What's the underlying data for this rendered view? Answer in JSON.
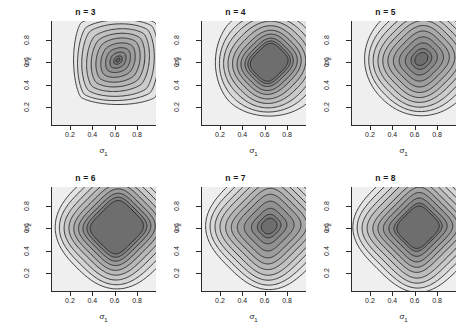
{
  "figure": {
    "kind": "contour-panel-grid",
    "rows": 2,
    "cols": 3,
    "background": "#ffffff",
    "line_color": "#1f1f1f",
    "fill_light": "#efefef",
    "fill_dark": "#6f6f6f"
  },
  "axes": {
    "x_label": "σ",
    "x_label_sub": "1",
    "y_label": "σ",
    "y_label_sub": "2",
    "x_ticks": [
      "0.2",
      "0.4",
      "0.6",
      "0.8"
    ],
    "y_ticks": [
      "0.2",
      "0.4",
      "0.6",
      "0.8"
    ],
    "x_tick_values": [
      0.2,
      0.4,
      0.6,
      0.8
    ],
    "y_tick_values": [
      0.2,
      0.4,
      0.6,
      0.8
    ],
    "xlim": [
      0.03,
      0.97
    ],
    "ylim": [
      0.03,
      0.97
    ]
  },
  "panels": [
    {
      "title": "n = 3",
      "n": 3
    },
    {
      "title": "n = 4",
      "n": 4
    },
    {
      "title": "n = 5",
      "n": 5
    },
    {
      "title": "n = 6",
      "n": 6
    },
    {
      "title": "n = 7",
      "n": 7
    },
    {
      "title": "n = 8",
      "n": 8
    }
  ],
  "chart_data": {
    "type": "contour",
    "title": "",
    "xlabel": "σ₁",
    "ylabel": "σ₂",
    "xlim": [
      0.03,
      0.97
    ],
    "ylim": [
      0.03,
      0.97
    ],
    "grid": false,
    "legend": "none",
    "shared_axes": true,
    "colormap": "grayscale (light = low, dark = high)",
    "panel_variable": "n",
    "panel_values": [
      3,
      4,
      5,
      6,
      7,
      8
    ],
    "n_contour_levels": 11,
    "panels": [
      {
        "title": "n = 3",
        "n": 3,
        "peak": [
          0.63,
          0.62
        ],
        "shape": "elongated diamond / ellipse tilted along the main diagonal",
        "innermost_level_extent": [
          0.05,
          0.05
        ],
        "corner_values": {
          "bottom_left": "low",
          "top_right": "low",
          "top_left": "lowest",
          "bottom_right": "lowest"
        },
        "contour_rings": [
          {
            "level": 1,
            "half_width": 0.47,
            "half_height": 0.47,
            "exponent": 1.35,
            "rot": 45
          },
          {
            "level": 2,
            "half_width": 0.43,
            "half_height": 0.41,
            "exponent": 1.4,
            "rot": 45
          },
          {
            "level": 3,
            "half_width": 0.38,
            "half_height": 0.36,
            "exponent": 1.45,
            "rot": 45
          },
          {
            "level": 4,
            "half_width": 0.33,
            "half_height": 0.3,
            "exponent": 1.5,
            "rot": 45
          },
          {
            "level": 5,
            "half_width": 0.28,
            "half_height": 0.25,
            "exponent": 1.55,
            "rot": 45
          },
          {
            "level": 6,
            "half_width": 0.23,
            "half_height": 0.2,
            "exponent": 1.6,
            "rot": 45
          },
          {
            "level": 7,
            "half_width": 0.18,
            "half_height": 0.15,
            "exponent": 1.65,
            "rot": 45
          },
          {
            "level": 8,
            "half_width": 0.13,
            "half_height": 0.105,
            "exponent": 1.7,
            "rot": 45
          },
          {
            "level": 9,
            "half_width": 0.085,
            "half_height": 0.065,
            "exponent": 1.75,
            "rot": 45
          },
          {
            "level": 10,
            "half_width": 0.045,
            "half_height": 0.032,
            "exponent": 1.8,
            "rot": 45
          },
          {
            "level": 11,
            "half_width": 0.02,
            "half_height": 0.013,
            "exponent": 1.9,
            "rot": 45
          }
        ]
      },
      {
        "title": "n = 4",
        "n": 4,
        "peak": [
          0.64,
          0.6
        ],
        "shape": "rounded square, slightly diamond-biased",
        "innermost_level_extent": [
          0.15,
          0.13
        ],
        "corner_values": {
          "bottom_left": "low",
          "top_right": "low",
          "top_left": "lowest",
          "bottom_right": "lowest"
        },
        "contour_rings": [
          {
            "level": 1,
            "half_width": 0.5,
            "half_height": 0.5,
            "exponent": 1.8,
            "rot": 45
          },
          {
            "level": 2,
            "half_width": 0.45,
            "half_height": 0.44,
            "exponent": 2.0,
            "rot": 45
          },
          {
            "level": 3,
            "half_width": 0.4,
            "half_height": 0.39,
            "exponent": 2.2,
            "rot": 45
          },
          {
            "level": 4,
            "half_width": 0.355,
            "half_height": 0.34,
            "exponent": 2.4,
            "rot": 45
          },
          {
            "level": 5,
            "half_width": 0.31,
            "half_height": 0.295,
            "exponent": 2.6,
            "rot": 45
          },
          {
            "level": 6,
            "half_width": 0.27,
            "half_height": 0.25,
            "exponent": 2.8,
            "rot": 45
          },
          {
            "level": 7,
            "half_width": 0.235,
            "half_height": 0.215,
            "exponent": 3.0,
            "rot": 45
          },
          {
            "level": 8,
            "half_width": 0.2,
            "half_height": 0.18,
            "exponent": 3.2,
            "rot": 45
          },
          {
            "level": 9,
            "half_width": 0.175,
            "half_height": 0.155,
            "exponent": 3.4,
            "rot": 45
          },
          {
            "level": 10,
            "half_width": 0.155,
            "half_height": 0.135,
            "exponent": 3.6,
            "rot": 45
          }
        ]
      },
      {
        "title": "n = 5",
        "n": 5,
        "peak": [
          0.66,
          0.63
        ],
        "shape": "rounded square with small inner ellipse",
        "innermost_level_extent": [
          0.07,
          0.055
        ],
        "corner_values": {
          "bottom_left": "low",
          "top_right": "low",
          "top_left": "lowest",
          "bottom_right": "lowest"
        },
        "contour_rings": [
          {
            "level": 1,
            "half_width": 0.5,
            "half_height": 0.5,
            "exponent": 2.1,
            "rot": 45
          },
          {
            "level": 2,
            "half_width": 0.455,
            "half_height": 0.445,
            "exponent": 2.3,
            "rot": 45
          },
          {
            "level": 3,
            "half_width": 0.41,
            "half_height": 0.395,
            "exponent": 2.5,
            "rot": 45
          },
          {
            "level": 4,
            "half_width": 0.365,
            "half_height": 0.345,
            "exponent": 2.7,
            "rot": 45
          },
          {
            "level": 5,
            "half_width": 0.32,
            "half_height": 0.3,
            "exponent": 2.9,
            "rot": 45
          },
          {
            "level": 6,
            "half_width": 0.275,
            "half_height": 0.255,
            "exponent": 3.1,
            "rot": 45
          },
          {
            "level": 7,
            "half_width": 0.23,
            "half_height": 0.21,
            "exponent": 3.2,
            "rot": 45
          },
          {
            "level": 8,
            "half_width": 0.185,
            "half_height": 0.165,
            "exponent": 3.1,
            "rot": 45
          },
          {
            "level": 9,
            "half_width": 0.14,
            "half_height": 0.12,
            "exponent": 2.8,
            "rot": 45
          },
          {
            "level": 10,
            "half_width": 0.095,
            "half_height": 0.08,
            "exponent": 2.4,
            "rot": 45
          },
          {
            "level": 11,
            "half_width": 0.065,
            "half_height": 0.05,
            "exponent": 2.0,
            "rot": 45
          }
        ]
      },
      {
        "title": "n = 6",
        "n": 6,
        "peak": [
          0.62,
          0.61
        ],
        "shape": "large rounded square plateau",
        "innermost_level_extent": [
          0.19,
          0.18
        ],
        "corner_values": {
          "bottom_left": "low",
          "top_right": "low",
          "top_left": "lowest",
          "bottom_right": "lowest"
        },
        "contour_rings": [
          {
            "level": 1,
            "half_width": 0.51,
            "half_height": 0.51,
            "exponent": 2.6,
            "rot": 45
          },
          {
            "level": 2,
            "half_width": 0.465,
            "half_height": 0.46,
            "exponent": 2.9,
            "rot": 45
          },
          {
            "level": 3,
            "half_width": 0.42,
            "half_height": 0.41,
            "exponent": 3.2,
            "rot": 45
          },
          {
            "level": 4,
            "half_width": 0.375,
            "half_height": 0.365,
            "exponent": 3.5,
            "rot": 45
          },
          {
            "level": 5,
            "half_width": 0.335,
            "half_height": 0.32,
            "exponent": 3.8,
            "rot": 45
          },
          {
            "level": 6,
            "half_width": 0.295,
            "half_height": 0.28,
            "exponent": 4.1,
            "rot": 45
          },
          {
            "level": 7,
            "half_width": 0.26,
            "half_height": 0.245,
            "exponent": 4.3,
            "rot": 45
          },
          {
            "level": 8,
            "half_width": 0.23,
            "half_height": 0.215,
            "exponent": 4.4,
            "rot": 45
          },
          {
            "level": 9,
            "half_width": 0.205,
            "half_height": 0.19,
            "exponent": 4.4,
            "rot": 45
          }
        ]
      },
      {
        "title": "n = 7",
        "n": 7,
        "peak": [
          0.64,
          0.62
        ],
        "shape": "rounded square with compact inner core",
        "innermost_level_extent": [
          0.08,
          0.07
        ],
        "corner_values": {
          "bottom_left": "low",
          "top_right": "low",
          "top_left": "lowest",
          "bottom_right": "lowest"
        },
        "contour_rings": [
          {
            "level": 1,
            "half_width": 0.515,
            "half_height": 0.515,
            "exponent": 2.8,
            "rot": 45
          },
          {
            "level": 2,
            "half_width": 0.47,
            "half_height": 0.465,
            "exponent": 3.1,
            "rot": 45
          },
          {
            "level": 3,
            "half_width": 0.425,
            "half_height": 0.415,
            "exponent": 3.4,
            "rot": 45
          },
          {
            "level": 4,
            "half_width": 0.38,
            "half_height": 0.37,
            "exponent": 3.7,
            "rot": 45
          },
          {
            "level": 5,
            "half_width": 0.335,
            "half_height": 0.32,
            "exponent": 4.0,
            "rot": 45
          },
          {
            "level": 6,
            "half_width": 0.29,
            "half_height": 0.275,
            "exponent": 4.2,
            "rot": 45
          },
          {
            "level": 7,
            "half_width": 0.245,
            "half_height": 0.23,
            "exponent": 4.2,
            "rot": 45
          },
          {
            "level": 8,
            "half_width": 0.195,
            "half_height": 0.18,
            "exponent": 4.0,
            "rot": 45
          },
          {
            "level": 9,
            "half_width": 0.145,
            "half_height": 0.13,
            "exponent": 3.4,
            "rot": 45
          },
          {
            "level": 10,
            "half_width": 0.1,
            "half_height": 0.09,
            "exponent": 2.8,
            "rot": 45
          },
          {
            "level": 11,
            "half_width": 0.072,
            "half_height": 0.062,
            "exponent": 2.3,
            "rot": 45
          }
        ]
      },
      {
        "title": "n = 8",
        "n": 8,
        "peak": [
          0.63,
          0.61
        ],
        "shape": "rounded square plateau, sharpest corners of the set",
        "innermost_level_extent": [
          0.16,
          0.15
        ],
        "corner_values": {
          "bottom_left": "low",
          "top_right": "low",
          "top_left": "lowest",
          "bottom_right": "lowest"
        },
        "contour_rings": [
          {
            "level": 1,
            "half_width": 0.52,
            "half_height": 0.52,
            "exponent": 3.0,
            "rot": 45
          },
          {
            "level": 2,
            "half_width": 0.475,
            "half_height": 0.47,
            "exponent": 3.4,
            "rot": 45
          },
          {
            "level": 3,
            "half_width": 0.43,
            "half_height": 0.42,
            "exponent": 3.8,
            "rot": 45
          },
          {
            "level": 4,
            "half_width": 0.385,
            "half_height": 0.375,
            "exponent": 4.2,
            "rot": 45
          },
          {
            "level": 5,
            "half_width": 0.34,
            "half_height": 0.325,
            "exponent": 4.6,
            "rot": 45
          },
          {
            "level": 6,
            "half_width": 0.3,
            "half_height": 0.285,
            "exponent": 4.9,
            "rot": 45
          },
          {
            "level": 7,
            "half_width": 0.26,
            "half_height": 0.245,
            "exponent": 5.0,
            "rot": 45
          },
          {
            "level": 8,
            "half_width": 0.22,
            "half_height": 0.205,
            "exponent": 4.9,
            "rot": 45
          },
          {
            "level": 9,
            "half_width": 0.185,
            "half_height": 0.17,
            "exponent": 4.6,
            "rot": 45
          },
          {
            "level": 10,
            "half_width": 0.165,
            "half_height": 0.152,
            "exponent": 4.2,
            "rot": 45
          }
        ]
      }
    ]
  }
}
